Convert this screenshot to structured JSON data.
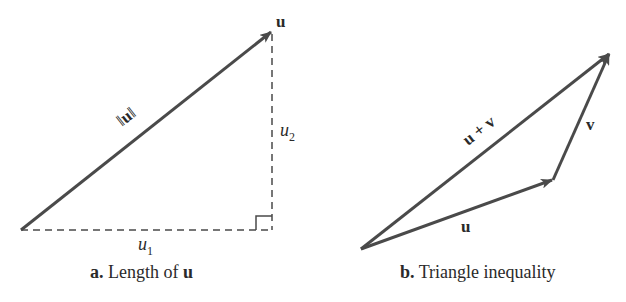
{
  "colors": {
    "stroke": "#4a4a4a",
    "text": "#2a2a2a",
    "background": "#ffffff"
  },
  "panel_a": {
    "caption_prefix": "a.",
    "caption_text": " Length of ",
    "caption_bold": "u",
    "vector_label": "u",
    "hypotenuse_label": "‖u‖",
    "horizontal_label": "u",
    "horizontal_subscript": "1",
    "vertical_label": "u",
    "vertical_subscript": "2",
    "points": {
      "origin": [
        21,
        230
      ],
      "tip": [
        272,
        31
      ],
      "corner": [
        272,
        230
      ]
    }
  },
  "panel_b": {
    "caption_prefix": "b.",
    "caption_text": " Triangle inequality",
    "u_label": "u",
    "v_label": "v",
    "sum_label": "u + v",
    "points": {
      "origin": [
        361,
        249
      ],
      "u_tip": [
        553,
        180
      ],
      "sum_tip": [
        610,
        53
      ]
    }
  }
}
